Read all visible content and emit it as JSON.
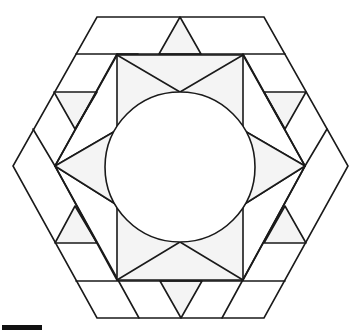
{
  "figure": {
    "colors": {
      "stroke": "#1a1a1a",
      "shade": "#f4f4f4",
      "background": "#ffffff",
      "scale_bar": "#111111"
    },
    "outer_hexagon": [
      [
        97,
        17
      ],
      [
        264,
        17
      ],
      [
        348,
        166
      ],
      [
        264,
        318
      ],
      [
        97,
        318
      ],
      [
        13,
        166
      ]
    ],
    "inner_hexagon": [
      [
        117,
        55
      ],
      [
        243,
        55
      ],
      [
        305,
        166
      ],
      [
        243,
        280
      ],
      [
        117,
        280
      ],
      [
        55,
        166
      ]
    ],
    "circle": {
      "cx": 180,
      "cy": 167,
      "r": 75
    },
    "scale_bar": {
      "x": 2,
      "y": 325,
      "width": 40,
      "height": 5
    }
  }
}
